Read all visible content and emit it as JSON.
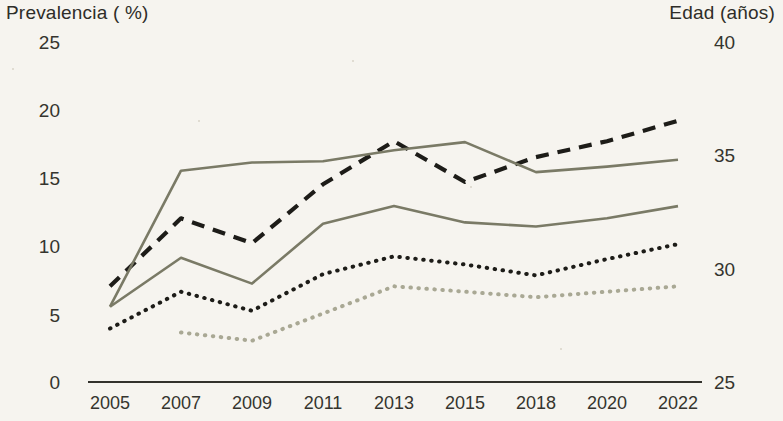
{
  "axes": {
    "left_title": "Prevalencia ( %)",
    "right_title": "Edad (años)",
    "left_ticks": [
      "25",
      "20",
      "15",
      "10",
      "5",
      "0"
    ],
    "right_ticks": [
      "40",
      "35",
      "30",
      "25"
    ],
    "x_ticks": [
      "2005",
      "2007",
      "2009",
      "2011",
      "2013",
      "2015",
      "2018",
      "2020",
      "2022"
    ]
  },
  "colors": {
    "background": "#f6f4ef",
    "axis": "#33322c",
    "text": "#2e2d28",
    "series_dashed_dark": "#1d1c18",
    "series_solid_upper": "#7a7a66",
    "series_solid_lower": "#7a7a66",
    "series_dotted_dark": "#1d1c18",
    "series_dotted_light": "#a9a894"
  },
  "chart_data": {
    "type": "line",
    "title": "",
    "xlabel": "",
    "ylabel": "Prevalencia ( %)",
    "y2label": "Edad (años)",
    "x": [
      "2005",
      "2007",
      "2009",
      "2011",
      "2013",
      "2015",
      "2018",
      "2020",
      "2022"
    ],
    "ylim": [
      0,
      25
    ],
    "y2lim": [
      25,
      40
    ],
    "grid": false,
    "legend": "none",
    "series": [
      {
        "name": "edad-media-dashed",
        "style": "dashed",
        "color": "#1d1c18",
        "axis": "right",
        "values": [
          29.2,
          32.2,
          31.1,
          33.7,
          35.6,
          33.8,
          34.9,
          35.6,
          36.5
        ],
        "values_left_scale": [
          9.2,
          15.5,
          13.1,
          17.8,
          22.1,
          18.5,
          20.5,
          21.9,
          23.5
        ]
      },
      {
        "name": "prevalencia-superior-solida",
        "style": "solid",
        "color": "#7a7a66",
        "axis": "left",
        "values": [
          5.5,
          15.5,
          16.1,
          16.2,
          17.0,
          17.6,
          15.4,
          15.8,
          16.3
        ]
      },
      {
        "name": "prevalencia-inferior-solida",
        "style": "solid",
        "color": "#7a7a66",
        "axis": "left",
        "values": [
          5.5,
          9.1,
          7.2,
          11.6,
          12.9,
          11.7,
          11.4,
          12.0,
          12.9
        ]
      },
      {
        "name": "prevalencia-punteada-oscura",
        "style": "dotted",
        "color": "#1d1c18",
        "axis": "left",
        "values": [
          3.9,
          6.6,
          5.2,
          7.9,
          9.2,
          8.6,
          7.8,
          9.0,
          10.1
        ]
      },
      {
        "name": "prevalencia-punteada-clara",
        "style": "dotted",
        "color": "#a9a894",
        "axis": "left",
        "values": [
          null,
          3.6,
          3.0,
          5.0,
          7.0,
          6.6,
          6.2,
          6.6,
          7.0
        ]
      }
    ]
  }
}
